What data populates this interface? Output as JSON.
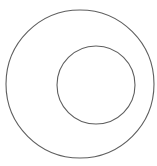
{
  "diagram": {
    "background": "#ffffff",
    "stroke_color": "#5f5f5f",
    "stroke_width": 1.1,
    "shapes": [
      {
        "type": "circle",
        "role": "outer",
        "cx": 80,
        "cy": 84,
        "r": 74
      },
      {
        "type": "circle",
        "role": "inner",
        "cx": 96,
        "cy": 85,
        "r": 39
      }
    ]
  }
}
